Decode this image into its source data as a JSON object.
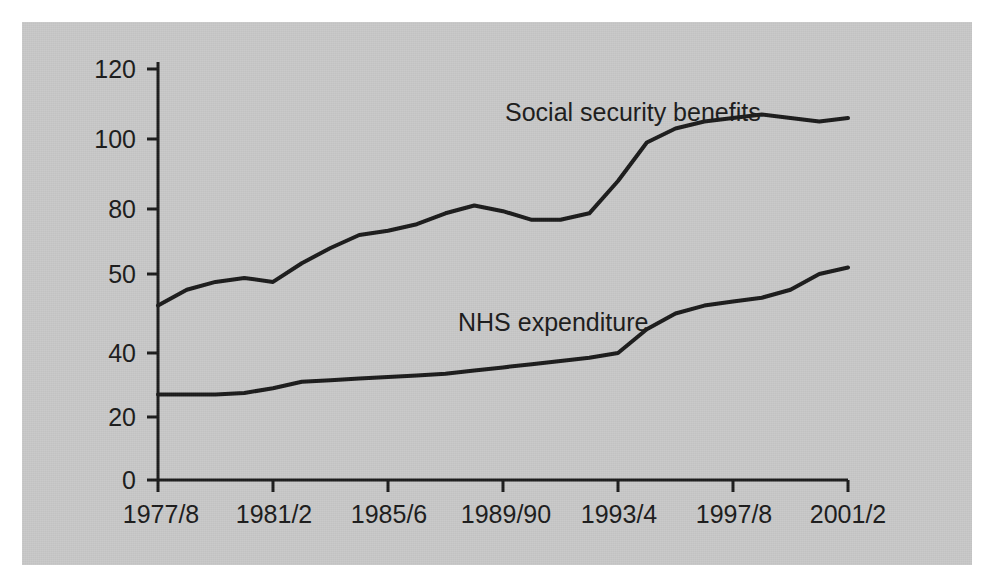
{
  "figure": {
    "background_color": "#ffffff",
    "panel_color": "#c9c9c9",
    "ink_color": "#1b1b1b"
  },
  "chart_data": {
    "type": "line",
    "title": "",
    "subtitle": "",
    "xlabel": "",
    "ylabel": "",
    "grid": false,
    "legend_position": "inline-annotation",
    "x_tick_labels": [
      "1977/8",
      "1981/2",
      "1985/6",
      "1989/90",
      "1993/4",
      "1997/8",
      "2001/2"
    ],
    "x_tick_values": [
      1977,
      1981,
      1985,
      1989,
      1993,
      1997,
      2001
    ],
    "xlim": [
      1977,
      2001
    ],
    "y_tick_labels": [
      "0",
      "20",
      "40",
      "50",
      "80",
      "100",
      "120"
    ],
    "y_tick_values": [
      0,
      20,
      40,
      50,
      80,
      100,
      120
    ],
    "ylim": [
      0,
      120
    ],
    "y_axis_note": "non-uniform hand-drawn spacing between 40 and 50",
    "x": [
      1977,
      1978,
      1979,
      1980,
      1981,
      1982,
      1983,
      1984,
      1985,
      1986,
      1987,
      1988,
      1989,
      1990,
      1991,
      1992,
      1993,
      1994,
      1995,
      1996,
      1997,
      1998,
      1999,
      2000,
      2001
    ],
    "series": [
      {
        "name": "Social security benefits",
        "label": "Social security benefits",
        "color": "#1b1b1b",
        "values": [
          46,
          48,
          49,
          49.5,
          49,
          55,
          62,
          68,
          70,
          73,
          78,
          81,
          79,
          75,
          75,
          78,
          88,
          99,
          103,
          105,
          106,
          107,
          106,
          105,
          106
        ]
      },
      {
        "name": "NHS expenditure",
        "label": "NHS expenditure",
        "color": "#1b1b1b",
        "values": [
          27,
          27,
          27,
          27.5,
          29,
          31,
          31.5,
          32,
          32.5,
          33,
          33.5,
          34.5,
          35.5,
          36.5,
          37.5,
          38.5,
          40,
          43,
          45,
          46,
          46.5,
          47,
          48,
          50,
          53
        ]
      }
    ],
    "annotations": [
      {
        "text": "Social security benefits",
        "x_px": 505,
        "y_px": 100
      },
      {
        "text": "NHS expenditure",
        "x_px": 458,
        "y_px": 310
      }
    ]
  }
}
